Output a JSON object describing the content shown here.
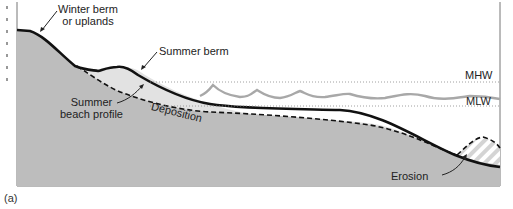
{
  "figure": {
    "panel_label": "(a)",
    "labels": {
      "winter_berm": [
        "Winter berm",
        "or uplands"
      ],
      "summer_berm": "Summer berm",
      "summer_profile": [
        "Summer",
        "beach profile"
      ],
      "deposition": "Deposition",
      "erosion": "Erosion",
      "mhw": "MHW",
      "mlw": "MLW"
    },
    "colors": {
      "background": "#ffffff",
      "land_fill": "#bdbdbd",
      "deposition_fill": "#e2e2e2",
      "profile_line": "#111111",
      "water_line": "#a8a8a8",
      "tide_line": "#888888",
      "frame": "#666666"
    }
  }
}
